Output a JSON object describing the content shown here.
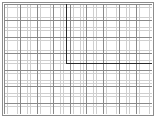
{
  "figure": {
    "width": 156,
    "height": 118,
    "background_color": "#ffffff",
    "frame": {
      "visible": true,
      "color": "#8c8c8c",
      "line_width": 1,
      "inset": 2
    }
  },
  "chart_data": {
    "type": "scatter",
    "title": "",
    "subtitle": "",
    "xlabel": "",
    "ylabel": "",
    "grid": true,
    "legend": null,
    "tick_labels": {
      "x": [],
      "y": []
    },
    "axis_ranges": {
      "xlim": [
        0,
        45
      ],
      "ylim": [
        0,
        33
      ]
    },
    "grid_spec": {
      "minor_spacing_px": 3.3,
      "major_every_n_minor": 5,
      "minor_color": "#cfcfcf",
      "major_color": "#8a8a8a",
      "minor_line_width": 0.6,
      "major_line_width": 0.9,
      "minor_columns": 45,
      "minor_rows": 33
    },
    "annotations": [
      {
        "name": "rectangle-outline",
        "shape": "rectangle",
        "x": 19,
        "y": 15,
        "width": 69,
        "height": 75,
        "edge_color": "#2a2a2a",
        "line_width": 1.4,
        "fill": "none"
      }
    ],
    "series": []
  },
  "plot_area": {
    "left_px": 4,
    "top_px": 4,
    "width_px": 148,
    "height_px": 110
  }
}
